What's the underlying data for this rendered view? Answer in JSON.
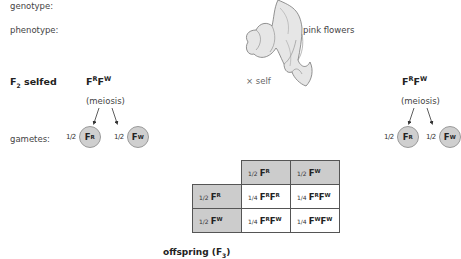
{
  "labels": {
    "genotype": "genotype:",
    "phenotype": "phenotype:",
    "gametes": "gametes:",
    "phenotype_value": "pink flowers",
    "cross": "× self",
    "generation_prefix": "F",
    "generation_sub": "2",
    "generation_suffix": " selfed",
    "offspring": "offspring (F",
    "offspring_sub": "3",
    "offspring_suffix": ")"
  },
  "parents": [
    {
      "genotype": {
        "a": "F",
        "a_sup": "R",
        "b": "F",
        "b_sup": "W"
      },
      "process": "(meiosis)",
      "gametes": [
        {
          "fraction": "1/2",
          "allele": "F",
          "sup": "R"
        },
        {
          "fraction": "1/2",
          "allele": "F",
          "sup": "W"
        }
      ]
    },
    {
      "genotype": {
        "a": "F",
        "a_sup": "R",
        "b": "F",
        "b_sup": "W"
      },
      "process": "(meiosis)",
      "gametes": [
        {
          "fraction": "1/2",
          "allele": "F",
          "sup": "R"
        },
        {
          "fraction": "1/2",
          "allele": "F",
          "sup": "W"
        }
      ]
    }
  ],
  "punnett": {
    "col_headers": [
      {
        "fraction": "1/2",
        "allele": "F",
        "sup": "R"
      },
      {
        "fraction": "1/2",
        "allele": "F",
        "sup": "W"
      }
    ],
    "rows": [
      {
        "header": {
          "fraction": "1/2",
          "allele": "F",
          "sup": "R"
        },
        "cells": [
          {
            "fraction": "1/4",
            "a": "F",
            "a_sup": "R",
            "b": "F",
            "b_sup": "R"
          },
          {
            "fraction": "1/4",
            "a": "F",
            "a_sup": "R",
            "b": "F",
            "b_sup": "W"
          }
        ]
      },
      {
        "header": {
          "fraction": "1/2",
          "allele": "F",
          "sup": "W"
        },
        "cells": [
          {
            "fraction": "1/4",
            "a": "F",
            "a_sup": "R",
            "b": "F",
            "b_sup": "W"
          },
          {
            "fraction": "1/4",
            "a": "F",
            "a_sup": "W",
            "b": "F",
            "b_sup": "W"
          }
        ]
      }
    ]
  },
  "colors": {
    "header_fill": "#cccccc",
    "gamete_fill": "#cfcfcf",
    "text": "#222222"
  }
}
